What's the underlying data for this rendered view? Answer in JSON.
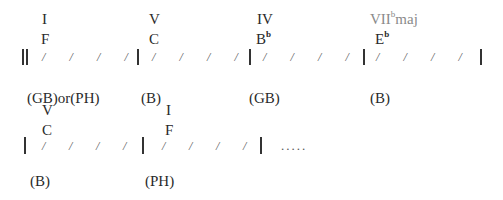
{
  "row1": {
    "measures": [
      {
        "numeral": "I",
        "chord": "F",
        "chord_accidental": "",
        "numeral_sup": "",
        "numeral_suffix": "",
        "section": "(GB)or(PH)"
      },
      {
        "numeral": "V",
        "chord": "C",
        "chord_accidental": "",
        "numeral_sup": "",
        "numeral_suffix": "",
        "section": "(B)"
      },
      {
        "numeral": "IV",
        "chord": "B",
        "chord_accidental": "b",
        "numeral_sup": "",
        "numeral_suffix": "",
        "section": "(GB)"
      },
      {
        "numeral": "VII",
        "chord": "E",
        "chord_accidental": "b",
        "numeral_sup": "b",
        "numeral_suffix": "maj",
        "section": "(B)"
      }
    ]
  },
  "row2": {
    "measures": [
      {
        "numeral": "V",
        "chord": "C",
        "section": "(B)"
      },
      {
        "numeral": "I",
        "chord": "F",
        "section": "(PH)"
      }
    ],
    "continuation": "....."
  },
  "beat_slash": "/",
  "beats_per_measure": 4,
  "colors": {
    "text": "#2a2a2a",
    "highlight_gray": "#8a8a8a"
  }
}
